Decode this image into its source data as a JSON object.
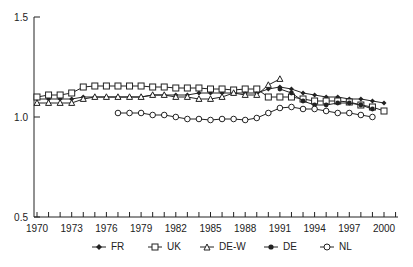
{
  "chart_data": {
    "type": "line",
    "title": "",
    "xlabel": "",
    "ylabel": "",
    "ylim": [
      0.5,
      1.5
    ],
    "xlim": [
      1970,
      2001
    ],
    "yticks": [
      "0.5",
      "1.0",
      "1.5"
    ],
    "xticks": [
      "1970",
      "1973",
      "1976",
      "1979",
      "1982",
      "1985",
      "1988",
      "1991",
      "1994",
      "1997",
      "2000"
    ],
    "grid": false,
    "legend_position": "bottom",
    "series": [
      {
        "name": "FR",
        "marker": "filled-diamond",
        "x": [
          1970,
          1971,
          1972,
          1973,
          1974,
          1975,
          1976,
          1977,
          1978,
          1979,
          1980,
          1981,
          1982,
          1983,
          1984,
          1985,
          1986,
          1987,
          1988,
          1989,
          1990,
          1991,
          1992,
          1993,
          1994,
          1995,
          1996,
          1997,
          1998,
          1999,
          2000
        ],
        "values": [
          1.09,
          1.09,
          1.09,
          1.09,
          1.1,
          1.1,
          1.1,
          1.1,
          1.1,
          1.1,
          1.11,
          1.11,
          1.11,
          1.11,
          1.12,
          1.12,
          1.12,
          1.12,
          1.12,
          1.12,
          1.14,
          1.15,
          1.14,
          1.12,
          1.11,
          1.1,
          1.1,
          1.09,
          1.09,
          1.08,
          1.07
        ]
      },
      {
        "name": "UK",
        "marker": "open-square",
        "x": [
          1970,
          1971,
          1972,
          1973,
          1974,
          1975,
          1976,
          1977,
          1978,
          1979,
          1980,
          1981,
          1982,
          1983,
          1984,
          1985,
          1986,
          1987,
          1988,
          1989,
          1990,
          1991,
          1992,
          1993,
          1994,
          1995,
          1996,
          1997,
          1998,
          1999,
          2000
        ],
        "values": [
          1.1,
          1.11,
          1.11,
          1.12,
          1.15,
          1.155,
          1.155,
          1.155,
          1.155,
          1.155,
          1.15,
          1.15,
          1.145,
          1.145,
          1.145,
          1.14,
          1.14,
          1.135,
          1.14,
          1.14,
          1.1,
          1.1,
          1.1,
          1.09,
          1.08,
          1.08,
          1.08,
          1.075,
          1.06,
          1.05,
          1.03
        ]
      },
      {
        "name": "DE-W",
        "marker": "open-triangle",
        "x": [
          1970,
          1971,
          1972,
          1973,
          1974,
          1975,
          1976,
          1977,
          1978,
          1979,
          1980,
          1981,
          1982,
          1983,
          1984,
          1985,
          1986,
          1987,
          1988,
          1989,
          1990,
          1991
        ],
        "values": [
          1.07,
          1.07,
          1.07,
          1.07,
          1.09,
          1.1,
          1.1,
          1.1,
          1.1,
          1.1,
          1.11,
          1.11,
          1.1,
          1.1,
          1.09,
          1.09,
          1.1,
          1.12,
          1.11,
          1.11,
          1.16,
          1.19
        ]
      },
      {
        "name": "DE",
        "marker": "filled-star",
        "x": [
          1991,
          1992,
          1993,
          1994,
          1995,
          1996,
          1997,
          1998,
          1999
        ],
        "values": [
          1.14,
          1.12,
          1.08,
          1.06,
          1.06,
          1.07,
          1.07,
          1.06,
          1.04
        ]
      },
      {
        "name": "NL",
        "marker": "open-circle",
        "x": [
          1977,
          1978,
          1979,
          1980,
          1981,
          1982,
          1983,
          1984,
          1985,
          1986,
          1987,
          1988,
          1989,
          1990,
          1991,
          1992,
          1993,
          1994,
          1995,
          1996,
          1997,
          1998,
          1999
        ],
        "values": [
          1.02,
          1.02,
          1.02,
          1.01,
          1.01,
          1.0,
          0.99,
          0.99,
          0.985,
          0.99,
          0.99,
          0.985,
          0.995,
          1.02,
          1.045,
          1.05,
          1.04,
          1.04,
          1.03,
          1.02,
          1.02,
          1.01,
          1.0
        ]
      }
    ]
  },
  "legend": {
    "items": [
      {
        "label": "FR"
      },
      {
        "label": "UK"
      },
      {
        "label": "DE-W"
      },
      {
        "label": "DE"
      },
      {
        "label": "NL"
      }
    ]
  }
}
